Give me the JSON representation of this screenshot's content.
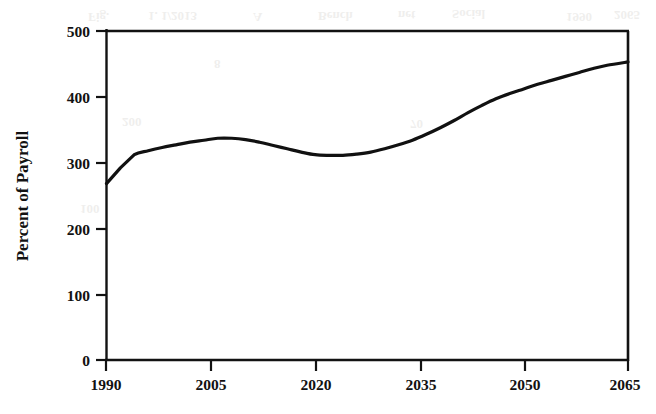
{
  "figure": {
    "background_color": "#ffffff",
    "ink_color": "#121212",
    "line_color": "#111111",
    "ghost_color": "#8a8478"
  },
  "chart_data": {
    "type": "line",
    "title": "",
    "subtitle": "",
    "xlabel": "",
    "ylabel": "Percent of Payroll",
    "xlim": [
      1990,
      2065
    ],
    "ylim": [
      0,
      500
    ],
    "xticks": [
      1990,
      2005,
      2020,
      2035,
      2050,
      2065
    ],
    "xtick_labels": [
      "1990",
      "2005",
      "2020",
      "2035",
      "2050",
      "2065"
    ],
    "yticks": [
      0,
      100,
      200,
      300,
      400,
      500
    ],
    "ytick_labels": [
      "0",
      "100",
      "200",
      "300",
      "400",
      "500"
    ],
    "grid": false,
    "legend": null,
    "legend_position": "none",
    "series": [
      {
        "name": "Percent of Payroll",
        "x": [
          1990,
          1992,
          1994,
          1996,
          1998,
          2000,
          2002,
          2004,
          2006,
          2008,
          2010,
          2012,
          2014,
          2016,
          2018,
          2020,
          2022,
          2024,
          2026,
          2028,
          2030,
          2032,
          2034,
          2036,
          2038,
          2040,
          2042,
          2044,
          2046,
          2048,
          2050,
          2052,
          2054,
          2056,
          2058,
          2060,
          2062,
          2065
        ],
        "values": [
          268,
          292,
          312,
          318,
          323,
          327,
          331,
          334,
          337,
          337,
          335,
          331,
          326,
          321,
          316,
          312,
          311,
          311,
          313,
          316,
          321,
          327,
          334,
          343,
          353,
          364,
          376,
          387,
          397,
          405,
          412,
          419,
          425,
          431,
          437,
          443,
          448,
          453
        ]
      }
    ],
    "annotations": []
  },
  "scan_artifacts": {
    "description": "faint bleed-through text from reverse of scanned page",
    "marks": [
      {
        "text": "Fig.",
        "x": 88,
        "y": 13
      },
      {
        "text": "1. 1/2013",
        "x": 148,
        "y": 12
      },
      {
        "text": "A",
        "x": 253,
        "y": 13
      },
      {
        "text": "Bench",
        "x": 318,
        "y": 12
      },
      {
        "text": "net",
        "x": 398,
        "y": 11
      },
      {
        "text": "Social",
        "x": 452,
        "y": 10
      },
      {
        "text": "1990",
        "x": 566,
        "y": 13
      },
      {
        "text": "2065",
        "x": 614,
        "y": 11
      },
      {
        "text": "200",
        "x": 122,
        "y": 118
      },
      {
        "text": "70",
        "x": 410,
        "y": 120
      },
      {
        "text": "8",
        "x": 214,
        "y": 60
      },
      {
        "text": "100",
        "x": 80,
        "y": 205
      }
    ]
  }
}
